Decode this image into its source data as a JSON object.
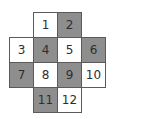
{
  "diagram": {
    "type": "cross-shaped numbered grid",
    "colors": {
      "shaded": "#8e8e8e",
      "unshaded": "#ffffff",
      "border": "#5a5a5a",
      "text": "#2e2e2e"
    },
    "cells": [
      {
        "label": "1",
        "row": 0,
        "col": 1,
        "shaded": false
      },
      {
        "label": "2",
        "row": 0,
        "col": 2,
        "shaded": true
      },
      {
        "label": "3",
        "row": 1,
        "col": 0,
        "shaded": false
      },
      {
        "label": "4",
        "row": 1,
        "col": 1,
        "shaded": true
      },
      {
        "label": "5",
        "row": 1,
        "col": 2,
        "shaded": false
      },
      {
        "label": "6",
        "row": 1,
        "col": 3,
        "shaded": true
      },
      {
        "label": "7",
        "row": 2,
        "col": 0,
        "shaded": true
      },
      {
        "label": "8",
        "row": 2,
        "col": 1,
        "shaded": false
      },
      {
        "label": "9",
        "row": 2,
        "col": 2,
        "shaded": true
      },
      {
        "label": "10",
        "row": 2,
        "col": 3,
        "shaded": false
      },
      {
        "label": "11",
        "row": 3,
        "col": 1,
        "shaded": true
      },
      {
        "label": "12",
        "row": 3,
        "col": 2,
        "shaded": false
      }
    ]
  }
}
